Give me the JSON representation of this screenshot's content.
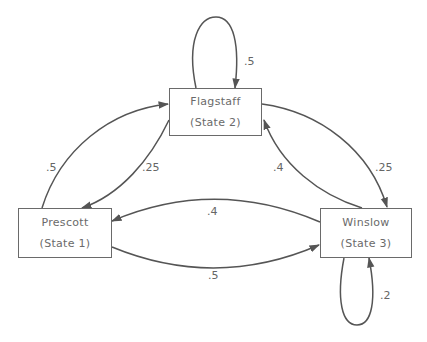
{
  "diagram": {
    "type": "markov-chain-state-transition",
    "colors": {
      "line": "#555555",
      "box_border": "#6a6a6a",
      "text": "#6a6a6a"
    },
    "nodes": [
      {
        "id": "state1",
        "name": "Prescott",
        "subtitle": "(State 1)"
      },
      {
        "id": "state2",
        "name": "Flagstaff",
        "subtitle": "(State 2)"
      },
      {
        "id": "state3",
        "name": "Winslow",
        "subtitle": "(State 3)"
      }
    ],
    "edges": [
      {
        "from": "state2",
        "to": "state2",
        "label": ".5"
      },
      {
        "from": "state1",
        "to": "state2",
        "label": ".5"
      },
      {
        "from": "state2",
        "to": "state1",
        "label": ".25"
      },
      {
        "from": "state2",
        "to": "state3",
        "label": ".25"
      },
      {
        "from": "state3",
        "to": "state2",
        "label": ".4"
      },
      {
        "from": "state3",
        "to": "state1",
        "label": ".4"
      },
      {
        "from": "state1",
        "to": "state3",
        "label": ".5"
      },
      {
        "from": "state3",
        "to": "state3",
        "label": ".2"
      }
    ]
  }
}
